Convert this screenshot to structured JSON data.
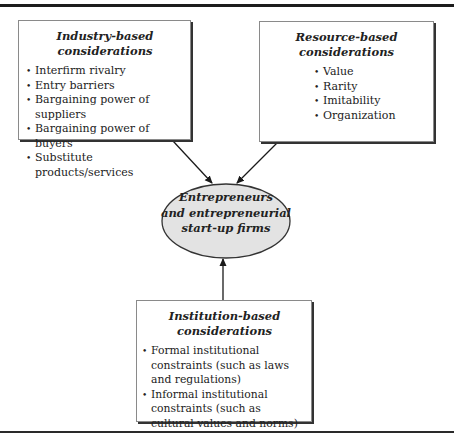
{
  "diagram": {
    "type": "conceptual-framework",
    "boxes": {
      "industry": {
        "title_line1": "Industry-based",
        "title_line2": "considerations",
        "items": [
          "Interfirm rivalry",
          "Entry barriers",
          "Bargaining power of suppliers",
          "Bargaining power of buyers",
          "Substitute products/services"
        ]
      },
      "resource": {
        "title_line1": "Resource-based",
        "title_line2": "considerations",
        "items": [
          "Value",
          "Rarity",
          "Imitability",
          "Organization"
        ]
      },
      "institution": {
        "title_line1": "Institution-based",
        "title_line2": "considerations",
        "items": [
          "Formal institutional constraints (such as laws and regulations)",
          "Informal institutional constraints (such as cultural values and norms)"
        ]
      }
    },
    "center": {
      "line1": "Entrepreneurs",
      "line2": "and entrepreneurial",
      "line3": "start-up firms",
      "fill": "#e3e3e3"
    },
    "arrows": [
      {
        "from": "industry",
        "to": "center"
      },
      {
        "from": "resource",
        "to": "center"
      },
      {
        "from": "institution",
        "to": "center"
      }
    ]
  }
}
